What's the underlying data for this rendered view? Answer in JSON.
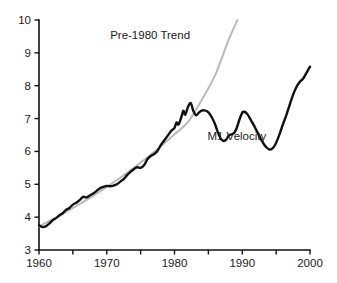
{
  "chart_data": {
    "type": "line",
    "title": "",
    "xlabel": "",
    "ylabel": "",
    "xlim": [
      1960,
      2000
    ],
    "ylim": [
      3,
      10
    ],
    "grid": false,
    "legend_position": "inline-annotation",
    "x_ticks": [
      1960,
      1965,
      1970,
      1975,
      1980,
      1985,
      1990,
      1995,
      2000
    ],
    "x_tick_labels": [
      "1960",
      "",
      "1970",
      "",
      "1980",
      "",
      "1990",
      "",
      "2000"
    ],
    "y_ticks": [
      3,
      4,
      5,
      6,
      7,
      8,
      9,
      10
    ],
    "y_tick_labels": [
      "3",
      "4",
      "5",
      "6",
      "7",
      "8",
      "9",
      "10"
    ],
    "series": [
      {
        "name": "M1 Velocity",
        "color": "#111111",
        "width": 2.4,
        "label_x": 1989.2,
        "label_y": 6.36,
        "x": [
          1960.0,
          1960.5,
          1961.0,
          1961.5,
          1962.0,
          1962.5,
          1963.0,
          1963.5,
          1964.0,
          1964.5,
          1965.0,
          1965.5,
          1966.0,
          1966.5,
          1967.0,
          1967.5,
          1968.0,
          1968.5,
          1969.0,
          1969.5,
          1970.0,
          1970.5,
          1971.0,
          1971.5,
          1972.0,
          1972.5,
          1973.0,
          1973.5,
          1974.0,
          1974.5,
          1975.0,
          1975.5,
          1976.0,
          1976.5,
          1977.0,
          1977.5,
          1978.0,
          1978.5,
          1979.0,
          1979.5,
          1980.0,
          1980.3,
          1980.6,
          1981.0,
          1981.3,
          1981.6,
          1982.0,
          1982.4,
          1982.8,
          1983.2,
          1983.6,
          1984.0,
          1984.4,
          1984.8,
          1985.2,
          1985.6,
          1986.0,
          1986.4,
          1986.8,
          1987.2,
          1987.6,
          1988.0,
          1988.4,
          1988.8,
          1989.2,
          1989.6,
          1990.0,
          1990.4,
          1990.8,
          1991.2,
          1991.6,
          1992.0,
          1992.4,
          1992.8,
          1993.2,
          1993.6,
          1994.0,
          1994.4,
          1994.8,
          1995.2,
          1995.6,
          1996.0,
          1996.5,
          1997.0,
          1997.5,
          1998.0,
          1998.5,
          1999.0,
          1999.5,
          2000.0
        ],
        "y": [
          3.75,
          3.7,
          3.72,
          3.8,
          3.9,
          3.97,
          4.05,
          4.12,
          4.22,
          4.28,
          4.38,
          4.44,
          4.52,
          4.62,
          4.6,
          4.66,
          4.72,
          4.8,
          4.88,
          4.92,
          4.95,
          4.94,
          4.96,
          5.0,
          5.08,
          5.16,
          5.28,
          5.38,
          5.46,
          5.52,
          5.5,
          5.58,
          5.76,
          5.86,
          5.92,
          6.02,
          6.2,
          6.34,
          6.48,
          6.62,
          6.72,
          6.88,
          6.82,
          7.04,
          7.24,
          7.12,
          7.36,
          7.47,
          7.22,
          7.1,
          7.18,
          7.24,
          7.25,
          7.22,
          7.14,
          7.0,
          6.82,
          6.58,
          6.4,
          6.32,
          6.35,
          6.48,
          6.52,
          6.56,
          6.72,
          6.98,
          7.18,
          7.2,
          7.12,
          6.98,
          6.84,
          6.68,
          6.52,
          6.36,
          6.22,
          6.12,
          6.06,
          6.08,
          6.18,
          6.36,
          6.58,
          6.82,
          7.1,
          7.42,
          7.72,
          7.96,
          8.12,
          8.22,
          8.4,
          8.58
        ]
      },
      {
        "name": "Pre-1980 Trend",
        "color": "#b9b9b9",
        "width": 2.0,
        "label_x": 1976.4,
        "label_y": 9.42,
        "x": [
          1960,
          1962,
          1964,
          1966,
          1968,
          1970,
          1972,
          1974,
          1976,
          1978,
          1980,
          1982,
          1984,
          1986,
          1988,
          1989.3
        ],
        "y": [
          3.72,
          3.93,
          4.16,
          4.4,
          4.65,
          4.92,
          5.2,
          5.5,
          5.82,
          6.16,
          6.52,
          6.9,
          7.56,
          8.32,
          9.4,
          10.0
        ]
      }
    ],
    "annotations": [
      {
        "text": "Pre-1980 Trend",
        "x": 1976.4,
        "y": 9.42
      },
      {
        "text": "M1 Velocity",
        "x": 1989.2,
        "y": 6.36
      }
    ]
  },
  "colors": {
    "background": "#ffffff",
    "axis": "#111111",
    "text": "#1a1a1a",
    "series_primary": "#111111",
    "series_trend": "#b9b9b9"
  }
}
